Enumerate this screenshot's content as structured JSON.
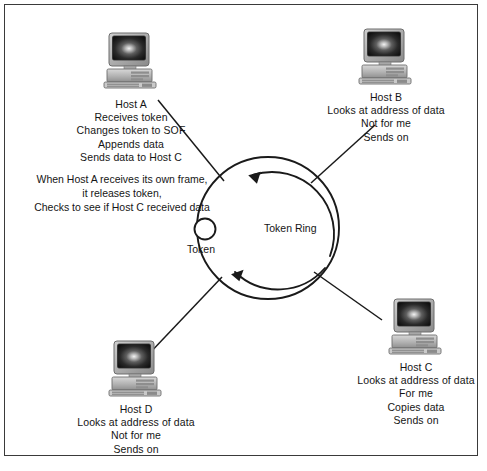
{
  "diagram": {
    "title": "Token Ring",
    "ring_label": "Token Ring",
    "token_label": "Token",
    "note": {
      "lines": [
        "When Host A receives its own frame,",
        "it releases token,",
        "Checks to see if Host C received data"
      ]
    },
    "hosts": [
      {
        "id": "host-a",
        "name": "Host A",
        "icon": "desktop-computer-icon",
        "lines": [
          "Host A",
          "Receives token",
          "Changes token to SOF",
          "Appends data",
          "Sends data to Host C"
        ]
      },
      {
        "id": "host-b",
        "name": "Host B",
        "icon": "desktop-computer-icon",
        "lines": [
          "Host B",
          "Looks at address of data",
          "Not for me",
          "Sends on"
        ]
      },
      {
        "id": "host-c",
        "name": "Host C",
        "icon": "desktop-computer-icon",
        "lines": [
          "Host C",
          "Looks at address of data",
          "For me",
          "Copies data",
          "Sends on"
        ]
      },
      {
        "id": "host-d",
        "name": "Host D",
        "icon": "desktop-computer-icon",
        "lines": [
          "Host D",
          "Looks at address of data",
          "Not for me",
          "Sends on"
        ]
      }
    ],
    "colors": {
      "background": "#ffffff",
      "border": "#3a3a3a",
      "line": "#1a1a1a",
      "text": "#151515",
      "monitor_dark": "#1d1d1d",
      "case_gray": "#b8b8b8"
    }
  }
}
